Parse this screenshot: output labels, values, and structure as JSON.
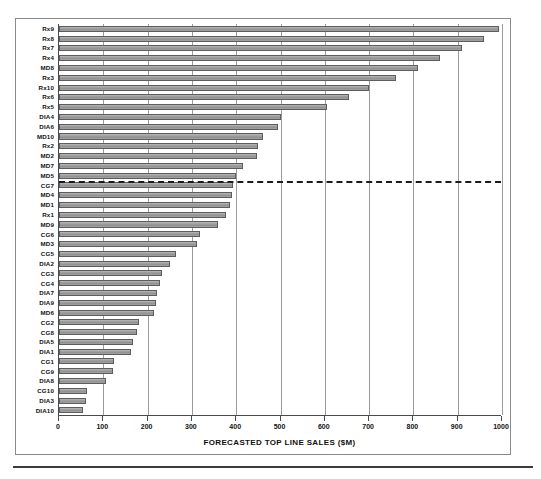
{
  "chart_data": {
    "type": "bar",
    "orientation": "horizontal",
    "title": "",
    "xlabel": "FORECASTED TOP LINE SALES ($M)",
    "ylabel": "",
    "xlim": [
      0,
      1000
    ],
    "xticks": [
      0,
      100,
      200,
      300,
      400,
      500,
      600,
      700,
      800,
      900,
      1000
    ],
    "grid": true,
    "legend": null,
    "bar_color": "#9e9e9e",
    "bar_edge_color": "#5d5d5d",
    "annotations": [
      {
        "type": "threshold-line",
        "style": "dashed",
        "color": "#1b1b1b",
        "after_category": "MD5",
        "label": ""
      }
    ],
    "categories": [
      "Rx9",
      "Rx8",
      "Rx7",
      "Rx4",
      "MD8",
      "Rx3",
      "Rx10",
      "Rx6",
      "Rx5",
      "DIA4",
      "DIA6",
      "MD10",
      "Rx2",
      "MD2",
      "MD7",
      "MD5",
      "CG7",
      "MD4",
      "MD1",
      "Rx1",
      "MD9",
      "CG6",
      "MD3",
      "CG5",
      "DIA2",
      "CG3",
      "CG4",
      "DIA7",
      "DIA9",
      "MD6",
      "CG2",
      "CG8",
      "DIA5",
      "DIA1",
      "CG1",
      "CG9",
      "DIA8",
      "CG10",
      "DIA3",
      "DIA10"
    ],
    "values": [
      993,
      960,
      910,
      860,
      810,
      760,
      700,
      655,
      605,
      500,
      495,
      460,
      450,
      448,
      415,
      400,
      393,
      390,
      385,
      378,
      360,
      318,
      312,
      265,
      250,
      232,
      228,
      222,
      218,
      215,
      180,
      175,
      168,
      162,
      125,
      122,
      105,
      63,
      60,
      55
    ]
  },
  "axis": {
    "x_title": "FORECASTED TOP LINE SALES ($M)",
    "tick_labels": [
      "0",
      "100",
      "200",
      "300",
      "400",
      "500",
      "600",
      "700",
      "800",
      "900",
      "1000"
    ]
  }
}
